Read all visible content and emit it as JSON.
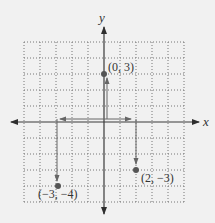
{
  "diagram": {
    "type": "coordinate-plane",
    "axes": {
      "x_label": "x",
      "y_label": "y",
      "x_range": [
        -5,
        5
      ],
      "y_range": [
        -5,
        5
      ],
      "grid": true
    },
    "points": [
      {
        "label": "(0, 3)",
        "x": 0,
        "y": 3
      },
      {
        "label": "(2, −3)",
        "x": 2,
        "y": -3
      },
      {
        "label": "(−3, −4)",
        "x": -3,
        "y": -4
      }
    ],
    "colors": {
      "background": "#f1f1f1",
      "grid": "#777777",
      "axis": "#3a3a3a",
      "point": "#555555",
      "arrow": "#666666"
    }
  }
}
